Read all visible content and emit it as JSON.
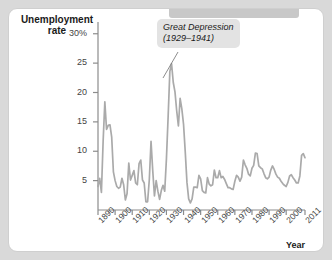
{
  "figure": {
    "background_color": "#ffffff",
    "page_background": "#d9d9d9",
    "line_color": "#aaaaaa",
    "axis_color": "#888888",
    "callout_background": "#e3e3e3"
  },
  "annotation": {
    "line1": "Great Depression",
    "line2": "(1929–1941)"
  },
  "chart_data": {
    "type": "line",
    "title": "",
    "ylabel": "Unemployment rate",
    "xlabel": "Year",
    "grid": false,
    "legend": null,
    "xlim": [
      1890,
      2011
    ],
    "ylim": [
      0,
      32
    ],
    "ytick_labels": [
      "30%",
      "25",
      "20",
      "15",
      "10",
      "5"
    ],
    "ytick_values": [
      30,
      25,
      20,
      15,
      10,
      5
    ],
    "xtick_labels": [
      "1890",
      "1900",
      "1910",
      "1920",
      "1930",
      "1940",
      "1950",
      "1960",
      "1970",
      "1980",
      "1990",
      "2000",
      "2011"
    ],
    "xtick_values": [
      1890,
      1900,
      1910,
      1920,
      1930,
      1940,
      1950,
      1960,
      1970,
      1980,
      1990,
      2000,
      2011
    ],
    "series": [
      {
        "name": "Unemployment rate",
        "x": [
          1890,
          1891,
          1892,
          1893,
          1894,
          1895,
          1896,
          1897,
          1898,
          1899,
          1900,
          1901,
          1902,
          1903,
          1904,
          1905,
          1906,
          1907,
          1908,
          1909,
          1910,
          1911,
          1912,
          1913,
          1914,
          1915,
          1916,
          1917,
          1918,
          1919,
          1920,
          1921,
          1922,
          1923,
          1924,
          1925,
          1926,
          1927,
          1928,
          1929,
          1930,
          1931,
          1932,
          1933,
          1934,
          1935,
          1936,
          1937,
          1938,
          1939,
          1940,
          1941,
          1942,
          1943,
          1944,
          1945,
          1946,
          1947,
          1948,
          1949,
          1950,
          1951,
          1952,
          1953,
          1954,
          1955,
          1956,
          1957,
          1958,
          1959,
          1960,
          1961,
          1962,
          1963,
          1964,
          1965,
          1966,
          1967,
          1968,
          1969,
          1970,
          1971,
          1972,
          1973,
          1974,
          1975,
          1976,
          1977,
          1978,
          1979,
          1980,
          1981,
          1982,
          1983,
          1984,
          1985,
          1986,
          1987,
          1988,
          1989,
          1990,
          1991,
          1992,
          1993,
          1994,
          1995,
          1996,
          1997,
          1998,
          1999,
          2000,
          2001,
          2002,
          2003,
          2004,
          2005,
          2006,
          2007,
          2008,
          2009,
          2010,
          2011
        ],
        "values": [
          4.0,
          5.4,
          3.0,
          11.7,
          18.4,
          13.7,
          14.4,
          14.5,
          12.4,
          6.5,
          5.0,
          4.0,
          3.7,
          3.9,
          5.4,
          4.3,
          1.7,
          2.8,
          8.0,
          5.1,
          5.9,
          6.7,
          4.6,
          4.3,
          7.9,
          8.5,
          5.1,
          4.6,
          1.4,
          1.4,
          5.2,
          11.7,
          6.7,
          2.4,
          5.0,
          3.2,
          1.8,
          3.3,
          4.2,
          3.2,
          8.7,
          15.9,
          23.6,
          24.9,
          21.7,
          20.1,
          16.9,
          14.3,
          19.0,
          17.2,
          14.6,
          9.9,
          4.7,
          1.9,
          1.2,
          1.9,
          3.9,
          3.9,
          3.8,
          5.9,
          5.3,
          3.3,
          3.0,
          2.9,
          5.5,
          4.4,
          4.1,
          4.3,
          6.8,
          5.5,
          5.5,
          6.7,
          5.5,
          5.7,
          5.2,
          4.5,
          3.8,
          3.8,
          3.6,
          3.5,
          4.9,
          5.9,
          5.6,
          4.9,
          5.6,
          8.5,
          7.7,
          7.1,
          6.1,
          5.8,
          7.1,
          7.6,
          9.7,
          9.6,
          7.5,
          7.2,
          7.0,
          6.2,
          5.5,
          5.3,
          5.6,
          6.8,
          7.5,
          6.9,
          6.1,
          5.6,
          5.4,
          4.9,
          4.5,
          4.2,
          4.0,
          4.7,
          5.8,
          6.0,
          5.5,
          5.1,
          4.6,
          4.6,
          5.8,
          9.3,
          9.6,
          8.9
        ]
      }
    ]
  }
}
